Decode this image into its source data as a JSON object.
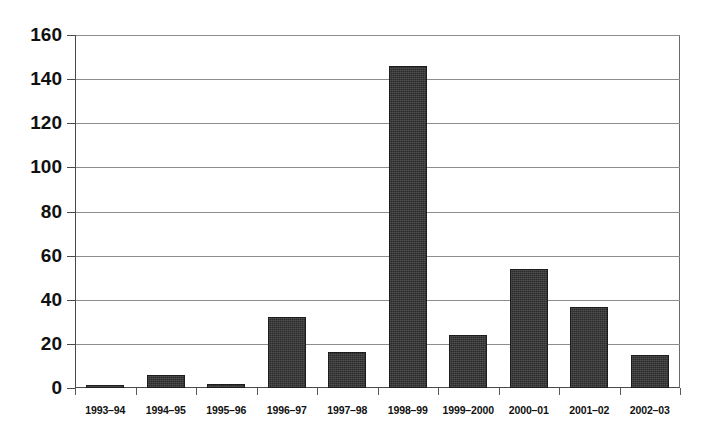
{
  "chart_data": {
    "type": "bar",
    "title": "",
    "subtitle": "",
    "xlabel": "",
    "ylabel": "",
    "ylim": [
      0,
      160
    ],
    "ytick_step": 20,
    "yticks": [
      0,
      20,
      40,
      60,
      80,
      100,
      120,
      140,
      160
    ],
    "ytick_labels": [
      "0",
      "20",
      "40",
      "60",
      "80",
      "100",
      "120",
      "140",
      "160"
    ],
    "grid": true,
    "grid_axis": "y",
    "legend": false,
    "legend_position": "none",
    "categories": [
      "1993–94",
      "1994–95",
      "1995–96",
      "1996–97",
      "1997–98",
      "1998–99",
      "1999–2000",
      "2000–01",
      "2001–02",
      "2002–03"
    ],
    "values": [
      1,
      6,
      2,
      32,
      16.5,
      146,
      24,
      54,
      36.5,
      15
    ],
    "series": [
      {
        "name": "",
        "values": [
          1,
          6,
          2,
          32,
          16.5,
          146,
          24,
          54,
          36.5,
          15
        ]
      }
    ],
    "annotations": []
  },
  "style": {
    "bar_color": "#2b2b2b",
    "bar_edge_color": "#1d1d1d",
    "grid_color": "#8d8d8d",
    "axis_color": "#4a4a4a",
    "background_color": "#ffffff",
    "text_color": "#111111"
  }
}
